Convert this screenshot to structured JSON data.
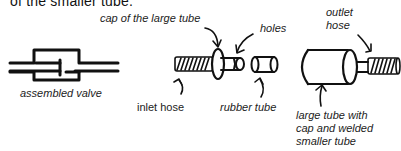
{
  "header": {
    "clipped_text": "of the smaller tube."
  },
  "labels": {
    "cap_of_large_tube": "cap of the large tube",
    "holes": "holes",
    "outlet_hose_1": "outlet",
    "outlet_hose_2": "hose",
    "assembled_valve": "assembled valve",
    "inlet_hose": "inlet hose",
    "rubber_tube": "rubber tube",
    "large_tube_1": "large tube with",
    "large_tube_2": "cap and welded",
    "large_tube_3": "smaller tube"
  },
  "colors": {
    "ink": "#111111",
    "background": "#ffffff"
  }
}
